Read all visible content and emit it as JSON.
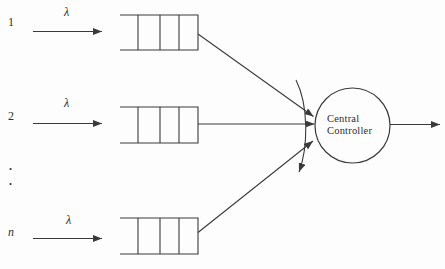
{
  "colors": {
    "background": "#fdfdfd",
    "line": "#3a3a3a",
    "text": "#2e2e2e"
  },
  "rows": [
    {
      "label": "1",
      "rate": "λ"
    },
    {
      "label": "2",
      "rate": "λ"
    },
    {
      "label": "n",
      "rate": "λ"
    }
  ],
  "ellipsis": {
    "dot1": ".",
    "dot2": "."
  },
  "controller": {
    "line1": "Central",
    "line2": "Controller"
  }
}
